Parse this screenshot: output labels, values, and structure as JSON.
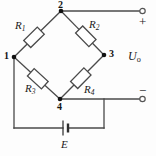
{
  "diagram": {
    "stroke_color": "#444444",
    "node_color": "#111111",
    "background": "#fdfdfd"
  },
  "resistors": [
    {
      "id": "R1",
      "name": "R",
      "sub": "1"
    },
    {
      "id": "R2",
      "name": "R",
      "sub": "2"
    },
    {
      "id": "R3",
      "name": "R",
      "sub": "3"
    },
    {
      "id": "R4",
      "name": "R",
      "sub": "4"
    }
  ],
  "nodes": [
    {
      "id": "n1",
      "label": "1"
    },
    {
      "id": "n2",
      "label": "2"
    },
    {
      "id": "n3",
      "label": "3"
    },
    {
      "id": "n4",
      "label": "4"
    }
  ],
  "source": {
    "label": "E"
  },
  "output": {
    "label": "U",
    "sub": "o",
    "plus": "+",
    "minus": "−"
  }
}
